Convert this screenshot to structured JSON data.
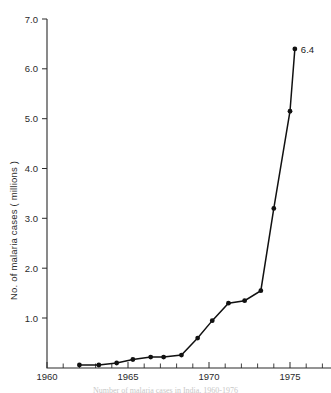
{
  "chart_data": {
    "type": "line",
    "title": "",
    "xlabel": "",
    "ylabel": "No. of malaria cases  ( millions )",
    "xlim": [
      1960,
      1976.5
    ],
    "ylim": [
      0,
      7.0
    ],
    "grid": false,
    "legend_position": "none",
    "x_ticks_labeled": [
      1960,
      1965,
      1970,
      1975
    ],
    "x_tick_labels": [
      "1960",
      "1965",
      "1970",
      "1975"
    ],
    "x_ticks_minor_step": 1,
    "y_ticks": [
      1.0,
      2.0,
      3.0,
      4.0,
      5.0,
      6.0,
      7.0
    ],
    "y_tick_labels": [
      "1.0",
      "2.0",
      "3.0",
      "4.0",
      "5.0",
      "6.0",
      "7.0"
    ],
    "x": [
      1962.0,
      1963.2,
      1964.3,
      1965.3,
      1966.4,
      1967.2,
      1968.3,
      1969.3,
      1970.2,
      1971.2,
      1972.2,
      1973.2,
      1974.0,
      1975.0,
      1975.3
    ],
    "values": [
      0.06,
      0.06,
      0.1,
      0.17,
      0.22,
      0.22,
      0.26,
      0.6,
      0.95,
      1.3,
      1.35,
      1.55,
      3.2,
      5.15,
      6.4
    ],
    "point_labels": [
      "",
      "",
      "",
      "",
      "",
      "",
      "",
      "",
      "",
      "",
      "",
      "",
      "",
      "",
      "6.4"
    ],
    "series": [
      {
        "name": "Malaria cases",
        "color": "#111111",
        "values": [
          0.06,
          0.06,
          0.1,
          0.17,
          0.22,
          0.22,
          0.26,
          0.6,
          0.95,
          1.3,
          1.35,
          1.55,
          3.2,
          5.15,
          6.4
        ]
      }
    ],
    "annotations": [
      {
        "text": "6.4",
        "x": 1975.3,
        "y": 6.4
      }
    ]
  },
  "axis": {
    "y_title": "No. of malaria cases  ( millions )",
    "y_labels": {
      "t7": "7.0",
      "t6": "6.0",
      "t5": "5.0",
      "t4": "4.0",
      "t3": "3.0",
      "t2": "2.0",
      "t1": "1.0"
    },
    "x_labels": {
      "x1960": "1960",
      "x1965": "1965",
      "x1970": "1970",
      "x1975": "1975"
    }
  },
  "annotation": {
    "peak_label": "6.4"
  },
  "caption": {
    "sliver_text": "Number of malaria cases in India, 1960-1976"
  },
  "colors": {
    "ink": "#111111",
    "axis": "#2b2b2b",
    "background": "#ffffff"
  }
}
